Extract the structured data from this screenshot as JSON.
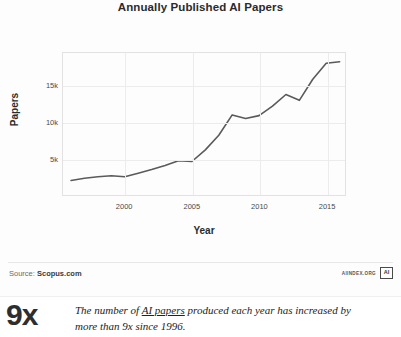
{
  "chart_data": {
    "type": "line",
    "title": "Annually Published AI Papers",
    "xlabel": "Year",
    "ylabel": "Papers",
    "xlim": [
      1995.4,
      2016.4
    ],
    "ylim": [
      0,
      19500
    ],
    "xticks": [
      2000,
      2005,
      2010,
      2015
    ],
    "yticks": [
      5000,
      10000,
      15000
    ],
    "ytick_labels": [
      "5k",
      "10k",
      "15k"
    ],
    "xtick_labels": [
      "2000",
      "2005",
      "2010",
      "2015"
    ],
    "grid": true,
    "legend": null,
    "line_color": "#5a5a5a",
    "x": [
      1996,
      1997,
      1998,
      1999,
      2000,
      2001,
      2002,
      2003,
      2004,
      2005,
      2006,
      2007,
      2008,
      2009,
      2010,
      2011,
      2012,
      2013,
      2014,
      2015,
      2016
    ],
    "values": [
      2000,
      2300,
      2500,
      2650,
      2500,
      3000,
      3500,
      4050,
      4700,
      4600,
      6200,
      8200,
      11000,
      10500,
      10900,
      12200,
      13800,
      13000,
      15900,
      18100,
      18300
    ],
    "series": [
      {
        "name": "Annually published AI papers",
        "values": [
          2000,
          2300,
          2500,
          2650,
          2500,
          3000,
          3500,
          4050,
          4700,
          4600,
          6200,
          8200,
          11000,
          10500,
          10900,
          12200,
          13800,
          13000,
          15900,
          18100,
          18300
        ]
      }
    ]
  },
  "footer": {
    "source_label": "Source:",
    "source_name": "Scopus.com",
    "brand_text": "AIINDEX.ORG",
    "brand_mark": "AI"
  },
  "callout": {
    "figure": "9x",
    "line1_a": "The number of ",
    "line1_link": "AI papers",
    "line1_b": " produced each year has",
    "line2": "increased by more than 9x since 1996."
  }
}
